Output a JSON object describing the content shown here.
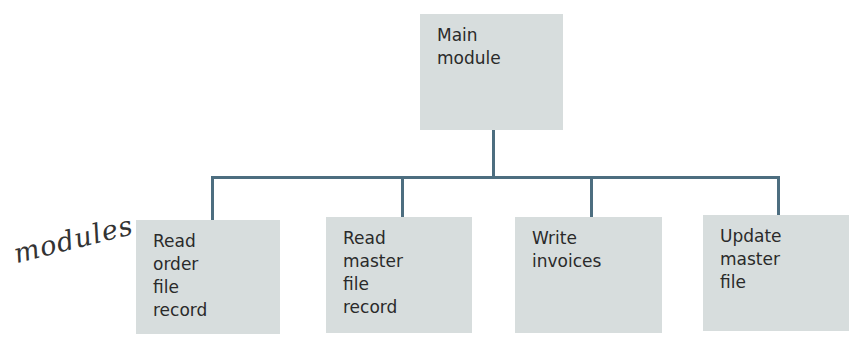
{
  "diagram": {
    "type": "hierarchy-chart",
    "root": {
      "lines": [
        "Main",
        "module"
      ]
    },
    "children": [
      {
        "lines": [
          "Read",
          "order",
          "file",
          "record"
        ]
      },
      {
        "lines": [
          "Read",
          "master",
          "file",
          "record"
        ]
      },
      {
        "lines": [
          "Write",
          "invoices"
        ]
      },
      {
        "lines": [
          "Update",
          "master",
          "file"
        ]
      }
    ],
    "annotation": "modules",
    "colors": {
      "box_fill": "#d7dddd",
      "connector": "#4d6e80",
      "text": "#2a2a2a"
    }
  }
}
